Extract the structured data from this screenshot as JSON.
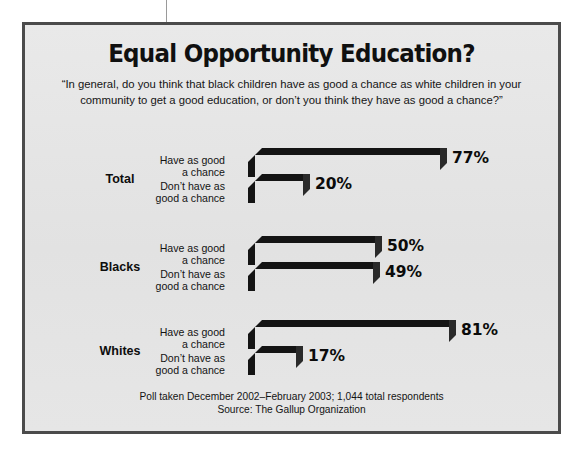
{
  "chart_data": {
    "type": "bar",
    "orientation": "horizontal",
    "title": "Equal Opportunity Education?",
    "subtitle": "“In general, do you think that black children have as good a chance as white children in your community to get a good education, or don’t you think they have as good a chance?”",
    "categories": [
      "Total",
      "Blacks",
      "Whites"
    ],
    "series": [
      {
        "name": "Have as good a chance",
        "values": [
          77,
          50,
          81
        ],
        "color": "#8b8b8b"
      },
      {
        "name": "Don’t have as good a chance",
        "values": [
          20,
          49,
          17
        ],
        "color": "#585858"
      }
    ],
    "value_labels": [
      "77%",
      "20%",
      "50%",
      "49%",
      "81%",
      "17%"
    ],
    "xlabel": "",
    "ylabel": "",
    "xlim": [
      0,
      100
    ],
    "grid": false,
    "legend": "none",
    "source_note": "Poll taken December 2002–February 2003; 1,044 total respondents",
    "source": "Source: The Gallup Organization"
  },
  "groups": [
    {
      "name": "Total",
      "rows": [
        {
          "label_line1": "Have as good",
          "label_line2": "a chance",
          "value": 77,
          "value_label": "77%"
        },
        {
          "label_line1": "Don’t have as",
          "label_line2": "good a chance",
          "value": 20,
          "value_label": "20%"
        }
      ]
    },
    {
      "name": "Blacks",
      "rows": [
        {
          "label_line1": "Have as good",
          "label_line2": "a chance",
          "value": 50,
          "value_label": "50%"
        },
        {
          "label_line1": "Don’t have as",
          "label_line2": "good a chance",
          "value": 49,
          "value_label": "49%"
        }
      ]
    },
    {
      "name": "Whites",
      "rows": [
        {
          "label_line1": "Have as good",
          "label_line2": "a chance",
          "value": 81,
          "value_label": "81%"
        },
        {
          "label_line1": "Don’t have as",
          "label_line2": "good a chance",
          "value": 17,
          "value_label": "17%"
        }
      ]
    }
  ],
  "footer": {
    "line1": "Poll taken December 2002–February 2003; 1,044 total respondents",
    "line2": "Source: The Gallup Organization"
  },
  "colors": {
    "panel_background": "#e4e4e4",
    "panel_border": "#4b4b4b",
    "bar_light": "#8b8b8b",
    "bar_dark": "#585858",
    "bar_shadow": "#141414",
    "text": "#101010"
  }
}
